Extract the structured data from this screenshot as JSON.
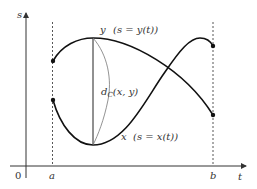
{
  "diagram": {
    "type": "function-distance-illustration",
    "axes": {
      "horizontal_label": "t",
      "vertical_label": "s",
      "origin_label": "0",
      "tick_labels": [
        "a",
        "b"
      ]
    },
    "curves": [
      {
        "id": "y",
        "name": "y",
        "annotation": "(s = y(t))"
      },
      {
        "id": "x",
        "name": "x",
        "annotation": "(s = x(t))"
      }
    ],
    "distance_label": {
      "prefix": "d",
      "subscript": "C",
      "args": "(x, y)"
    },
    "colors": {
      "curve": "#111111",
      "axis": "#333333",
      "dashed": "#444444",
      "thin": "#777777"
    }
  }
}
